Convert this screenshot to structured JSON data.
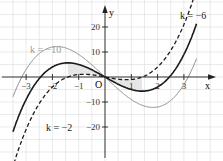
{
  "chart_data": {
    "type": "line",
    "title": "",
    "xlabel": "x",
    "ylabel": "y",
    "origin_label": "O",
    "function": "f_k(x) = x^3 + k*x",
    "xlim": [
      -3.4,
      3.9
    ],
    "ylim": [
      -29,
      28
    ],
    "grid": true,
    "x_ticks": [
      -3,
      -2,
      -1,
      1,
      2,
      3
    ],
    "x_tick_labels": [
      "−3",
      "−2",
      "−1",
      "1",
      "2",
      "3"
    ],
    "y_ticks": [
      20,
      10,
      -10,
      -20
    ],
    "y_tick_labels": [
      "20",
      "10",
      "−10",
      "−20"
    ],
    "series": [
      {
        "name": "k = −10",
        "k": -10,
        "style": "solid",
        "color": "#8a8a8a",
        "width": 1.0,
        "label_pos": [
          30,
          53
        ],
        "label_color": "#9a9a9a"
      },
      {
        "name": "k = −6",
        "k": -6,
        "style": "solid",
        "color": "#1a1a1a",
        "width": 1.6,
        "label_pos": [
          180,
          19
        ],
        "label_color": "#1a1a1a"
      },
      {
        "name": "k = −2",
        "k": -2,
        "style": "dashed",
        "color": "#1a1a1a",
        "width": 1.3,
        "label_pos": [
          46,
          131
        ],
        "label_color": "#1a1a1a"
      }
    ],
    "shaded_region": {
      "between": [
        "k = −6",
        "k = −2"
      ],
      "color": "#e6e6e6"
    }
  },
  "axes": {
    "x_label": "x",
    "y_label": "y",
    "origin": "O"
  }
}
